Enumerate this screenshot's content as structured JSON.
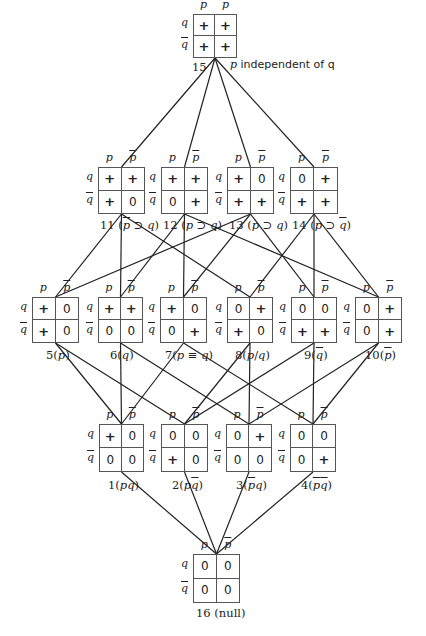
{
  "diagram": {
    "type": "lattice",
    "col_headers": [
      "p",
      "p̄"
    ],
    "row_headers": [
      "q",
      "q̄"
    ],
    "top_note": "p independent of q",
    "nodes": [
      {
        "id": 15,
        "label": "15",
        "cells": [
          [
            "+",
            "+"
          ],
          [
            "+",
            "+"
          ]
        ],
        "x": 193,
        "y": 14,
        "w": 44,
        "h": 44,
        "label_x": 192,
        "label_y": 60
      },
      {
        "id": 11,
        "label": "11 (p̄ ⊃ q)",
        "cells": [
          [
            "+",
            "+"
          ],
          [
            "+",
            "0"
          ]
        ],
        "x": 98,
        "y": 167,
        "w": 47,
        "h": 47,
        "label_x": 100,
        "label_y": 218
      },
      {
        "id": 12,
        "label": "12 (p ⊃ q)",
        "cells": [
          [
            "+",
            "+"
          ],
          [
            "0",
            "+"
          ]
        ],
        "x": 161,
        "y": 167,
        "w": 47,
        "h": 47,
        "label_x": 163,
        "label_y": 218
      },
      {
        "id": 13,
        "label": "13 (p ⊃ q)",
        "cells": [
          [
            "+",
            "0"
          ],
          [
            "+",
            "+"
          ]
        ],
        "x": 227,
        "y": 167,
        "w": 47,
        "h": 47,
        "label_x": 229,
        "label_y": 218
      },
      {
        "id": 14,
        "label": "14 (p ⊃ q̄)",
        "cells": [
          [
            "0",
            "+"
          ],
          [
            "+",
            "+"
          ]
        ],
        "x": 290,
        "y": 167,
        "w": 48,
        "h": 47,
        "label_x": 292,
        "label_y": 218
      },
      {
        "id": 5,
        "label": "5(p)",
        "cells": [
          [
            "+",
            "0"
          ],
          [
            "+",
            "0"
          ]
        ],
        "x": 32,
        "y": 297,
        "w": 47,
        "h": 46,
        "label_x": 46,
        "label_y": 348
      },
      {
        "id": 6,
        "label": "6(q)",
        "cells": [
          [
            "+",
            "+"
          ],
          [
            "0",
            "0"
          ]
        ],
        "x": 98,
        "y": 297,
        "w": 45,
        "h": 46,
        "label_x": 110,
        "label_y": 348
      },
      {
        "id": 7,
        "label": "7(p ≡ q)",
        "cells": [
          [
            "+",
            "0"
          ],
          [
            "0",
            "+"
          ]
        ],
        "x": 160,
        "y": 297,
        "w": 47,
        "h": 46,
        "label_x": 165,
        "label_y": 348
      },
      {
        "id": 8,
        "label": "8(p/q)",
        "cells": [
          [
            "0",
            "+"
          ],
          [
            "+",
            "0"
          ]
        ],
        "x": 227,
        "y": 297,
        "w": 46,
        "h": 46,
        "label_x": 235,
        "label_y": 348
      },
      {
        "id": 9,
        "label": "9(q̄)",
        "cells": [
          [
            "0",
            "0"
          ],
          [
            "+",
            "+"
          ]
        ],
        "x": 291,
        "y": 297,
        "w": 46,
        "h": 46,
        "label_x": 304,
        "label_y": 348
      },
      {
        "id": 10,
        "label": "10(p̄)",
        "cells": [
          [
            "0",
            "+"
          ],
          [
            "0",
            "+"
          ]
        ],
        "x": 355,
        "y": 297,
        "w": 47,
        "h": 46,
        "label_x": 365,
        "label_y": 348
      },
      {
        "id": 1,
        "label": "1(pq)",
        "cells": [
          [
            "+",
            "0"
          ],
          [
            "0",
            "0"
          ]
        ],
        "x": 99,
        "y": 424,
        "w": 45,
        "h": 48,
        "label_x": 108,
        "label_y": 478
      },
      {
        "id": 2,
        "label": "2(pq̄)",
        "cells": [
          [
            "0",
            "0"
          ],
          [
            "+",
            "0"
          ]
        ],
        "x": 161,
        "y": 424,
        "w": 47,
        "h": 48,
        "label_x": 172,
        "label_y": 478
      },
      {
        "id": 3,
        "label": "3(p̄q)",
        "cells": [
          [
            "0",
            "+"
          ],
          [
            "0",
            "0"
          ]
        ],
        "x": 226,
        "y": 424,
        "w": 46,
        "h": 48,
        "label_x": 236,
        "label_y": 478
      },
      {
        "id": 4,
        "label": "4(p̄q̄)",
        "cells": [
          [
            "0",
            "0"
          ],
          [
            "0",
            "+"
          ]
        ],
        "x": 290,
        "y": 424,
        "w": 46,
        "h": 48,
        "label_x": 301,
        "label_y": 478
      },
      {
        "id": 16,
        "label": "16 (null)",
        "cells": [
          [
            "0",
            "0"
          ],
          [
            "0",
            "0"
          ]
        ],
        "x": 193,
        "y": 554,
        "w": 47,
        "h": 49,
        "label_x": 196,
        "label_y": 606
      }
    ],
    "edges": [
      [
        15,
        11
      ],
      [
        15,
        12
      ],
      [
        15,
        13
      ],
      [
        15,
        14
      ],
      [
        11,
        5
      ],
      [
        11,
        6
      ],
      [
        11,
        8
      ],
      [
        12,
        6
      ],
      [
        12,
        10
      ],
      [
        12,
        7
      ],
      [
        13,
        5
      ],
      [
        13,
        7
      ],
      [
        13,
        9
      ],
      [
        14,
        8
      ],
      [
        14,
        9
      ],
      [
        14,
        10
      ],
      [
        5,
        1
      ],
      [
        5,
        2
      ],
      [
        6,
        1
      ],
      [
        6,
        3
      ],
      [
        7,
        1
      ],
      [
        7,
        4
      ],
      [
        8,
        2
      ],
      [
        8,
        3
      ],
      [
        9,
        2
      ],
      [
        9,
        4
      ],
      [
        10,
        3
      ],
      [
        10,
        4
      ],
      [
        1,
        16
      ],
      [
        2,
        16
      ],
      [
        3,
        16
      ],
      [
        4,
        16
      ]
    ],
    "edge_color": "#222222",
    "box_border_color": "#555555"
  }
}
